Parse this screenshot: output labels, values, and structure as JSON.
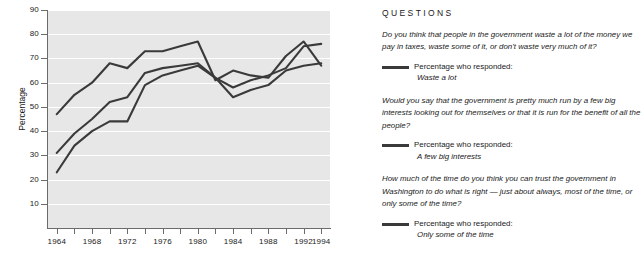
{
  "chart_data": {
    "type": "line",
    "title": "",
    "xlabel": "",
    "ylabel": "Percentage",
    "xlim": [
      1963,
      1995
    ],
    "ylim": [
      0,
      90
    ],
    "yticks": [
      10,
      20,
      30,
      40,
      50,
      60,
      70,
      80,
      90
    ],
    "xticks": [
      1964,
      1966,
      1968,
      1970,
      1972,
      1974,
      1976,
      1978,
      1980,
      1982,
      1984,
      1986,
      1988,
      1990,
      1992,
      1994
    ],
    "xtick_labels": [
      "1964",
      "",
      "1968",
      "",
      "1972",
      "",
      "1976",
      "",
      "1980",
      "",
      "1984",
      "",
      "1988",
      "",
      "1992",
      "1994"
    ],
    "grid": "horizontal",
    "legend_position": "right-panel",
    "x": [
      1964,
      1966,
      1968,
      1970,
      1972,
      1974,
      1976,
      1978,
      1980,
      1982,
      1984,
      1986,
      1988,
      1990,
      1992,
      1994
    ],
    "series": [
      {
        "name": "Waste a lot",
        "values": [
          47,
          55,
          60,
          68,
          66,
          73,
          73,
          75,
          77,
          61,
          65,
          63,
          62,
          71,
          77,
          67
        ]
      },
      {
        "name": "A few big interests",
        "values": [
          31,
          39,
          45,
          52,
          54,
          64,
          66,
          67,
          68,
          62,
          58,
          61,
          63,
          66,
          75,
          76
        ]
      },
      {
        "name": "Only some of the time",
        "values": [
          23,
          34,
          40,
          44,
          44,
          59,
          63,
          65,
          67,
          62,
          54,
          57,
          59,
          65,
          67,
          68
        ]
      }
    ],
    "line_color": "#3a3a3a",
    "plot_background": "#e7e7e7",
    "gridline_color": "#ffffff"
  },
  "chart": {
    "y_axis_title": "Percentage"
  },
  "questions": {
    "heading": "QUESTIONS",
    "items": [
      {
        "prompt": "Do you think that people in the government waste a lot of the money we pay in taxes, waste some of it, or don't waste very much of it?",
        "legend_label": "Percentage who responded:",
        "legend_response": "Waste a lot"
      },
      {
        "prompt": "Would you say that the government is pretty much run by a few big interests looking out for themselves or that it is run for the benefit of all the people?",
        "legend_label": "Percentage who responded:",
        "legend_response": "A few big interests"
      },
      {
        "prompt": "How much of the time do you think you can trust the government in Washington to do what is right — just about always, most of the time, or only some of the time?",
        "legend_label": "Percentage who responded:",
        "legend_response": "Only some of the time"
      }
    ]
  }
}
